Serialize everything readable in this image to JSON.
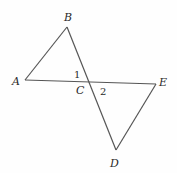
{
  "diagram": {
    "type": "geometry",
    "points": {
      "A": {
        "label": "A",
        "x": 25,
        "y": 80
      },
      "B": {
        "label": "B",
        "x": 67,
        "y": 27
      },
      "C": {
        "label": "C",
        "x": 88,
        "y": 81
      },
      "D": {
        "label": "D",
        "x": 116,
        "y": 150
      },
      "E": {
        "label": "E",
        "x": 156,
        "y": 84
      }
    },
    "segments": [
      [
        "A",
        "B"
      ],
      [
        "B",
        "D"
      ],
      [
        "A",
        "E"
      ],
      [
        "E",
        "D"
      ]
    ],
    "angles": [
      {
        "label": "1",
        "vertex": "C",
        "between": [
          "A",
          "B"
        ]
      },
      {
        "label": "2",
        "vertex": "C",
        "between": [
          "E",
          "D"
        ]
      }
    ],
    "colors": {
      "line": "#555555",
      "text": "#2a2a2a",
      "background": "#fefefe"
    }
  }
}
